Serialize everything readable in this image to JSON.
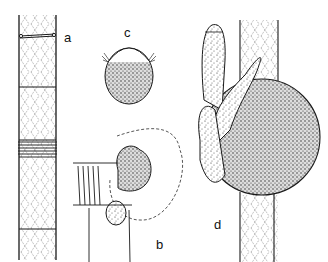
{
  "figure": {
    "panels": [
      {
        "id": "a",
        "label": "a",
        "description": "segmented filament with septa and ring bands"
      },
      {
        "id": "b",
        "label": "b",
        "description": "stippled body emerging from ringed filament end, dashed outline"
      },
      {
        "id": "c",
        "label": "c",
        "description": "oval stippled cell with fringed cap"
      },
      {
        "id": "d",
        "label": "d",
        "description": "large stippled sphere attached to filament with finger-like lobes"
      }
    ],
    "colors": {
      "ink": "#1a1a1a",
      "background": "#ffffff"
    }
  }
}
